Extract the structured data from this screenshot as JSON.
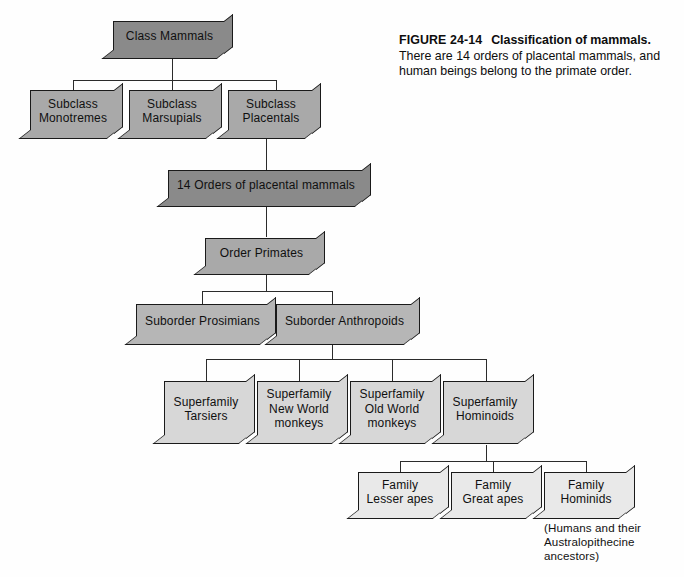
{
  "figure": {
    "number_label": "FIGURE 24-14",
    "title": "Classification of mammals.",
    "body": "There are 14 orders of placental mammals, and human beings belong to the primate order."
  },
  "colors": {
    "class_level": "#8a8a8a",
    "subclass_level": "#a9a9a9",
    "orders_level": "#8a8a8a",
    "order_level": "#a9a9a9",
    "suborder_level": "#b6b6b6",
    "superfamily_level": "#d7d7d7",
    "family_level": "#e9e9e9",
    "line": "#2b2b2b",
    "outline": "#1a1a1a",
    "background": "#fefefe"
  },
  "diagram": {
    "type": "hierarchy-tree",
    "levels": [
      {
        "rank": "Class",
        "nodes": [
          {
            "id": "class-mammals",
            "label": "Class Mammals"
          }
        ]
      },
      {
        "rank": "Subclass",
        "nodes": [
          {
            "id": "subclass-monotremes",
            "line1": "Subclass",
            "line2": "Monotremes"
          },
          {
            "id": "subclass-marsupials",
            "line1": "Subclass",
            "line2": "Marsupials"
          },
          {
            "id": "subclass-placentals",
            "line1": "Subclass",
            "line2": "Placentals"
          }
        ]
      },
      {
        "rank": "Orders",
        "nodes": [
          {
            "id": "orders-placental",
            "label": "14 Orders of placental mammals"
          }
        ]
      },
      {
        "rank": "Order",
        "nodes": [
          {
            "id": "order-primates",
            "label": "Order Primates"
          }
        ]
      },
      {
        "rank": "Suborder",
        "nodes": [
          {
            "id": "suborder-prosimians",
            "label": "Suborder Prosimians"
          },
          {
            "id": "suborder-anthropoids",
            "label": "Suborder Anthropoids"
          }
        ]
      },
      {
        "rank": "Superfamily",
        "nodes": [
          {
            "id": "superfamily-tarsiers",
            "line1": "Superfamily",
            "line2": "Tarsiers",
            "line3": ""
          },
          {
            "id": "superfamily-new-world-monkeys",
            "line1": "Superfamily",
            "line2": "New World",
            "line3": "monkeys"
          },
          {
            "id": "superfamily-old-world-monkeys",
            "line1": "Superfamily",
            "line2": "Old World",
            "line3": "monkeys"
          },
          {
            "id": "superfamily-hominoids",
            "line1": "Superfamily",
            "line2": "Hominoids",
            "line3": ""
          }
        ]
      },
      {
        "rank": "Family",
        "nodes": [
          {
            "id": "family-lesser-apes",
            "line1": "Family",
            "line2": "Lesser apes"
          },
          {
            "id": "family-great-apes",
            "line1": "Family",
            "line2": "Great apes"
          },
          {
            "id": "family-hominids",
            "line1": "Family",
            "line2": "Hominids"
          }
        ]
      }
    ],
    "annotations": [
      {
        "id": "hominids-note",
        "line1": "(Humans and their",
        "line2": "Australopithecine",
        "line3": "ancestors)"
      }
    ]
  }
}
